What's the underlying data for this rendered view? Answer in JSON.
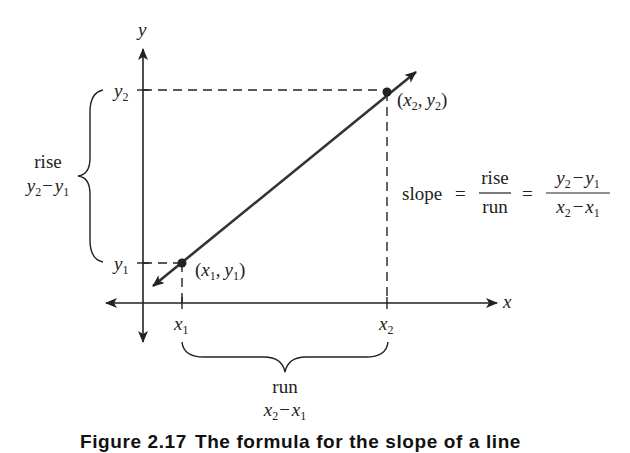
{
  "diagram": {
    "type": "slope-of-line",
    "axes": {
      "x_label": "x",
      "y_label": "y"
    },
    "points": [
      {
        "id": "p1",
        "label": "(x1, y1)",
        "x_name": "x",
        "x_sub": "1",
        "y_name": "y",
        "y_sub": "1"
      },
      {
        "id": "p2",
        "label": "(x2, y2)",
        "x_name": "x",
        "x_sub": "2",
        "y_name": "y",
        "y_sub": "2"
      }
    ],
    "ticks": {
      "x1": {
        "name": "x",
        "sub": "1"
      },
      "x2": {
        "name": "x",
        "sub": "2"
      },
      "y1": {
        "name": "y",
        "sub": "1"
      },
      "y2": {
        "name": "y",
        "sub": "2"
      }
    },
    "rise": {
      "label": "rise",
      "expression": "y2 − y1",
      "a": "y",
      "a_sub": "2",
      "minus": "−",
      "b": "y",
      "b_sub": "1"
    },
    "run": {
      "label": "run",
      "expression": "x2 − x1",
      "a": "x",
      "a_sub": "2",
      "minus": "−",
      "b": "x",
      "b_sub": "1"
    },
    "formula": {
      "lhs": "slope",
      "eq": "=",
      "frac1_num": "rise",
      "frac1_den": "run",
      "frac2_num": "y2 − y1",
      "frac2_den": "x2 − x1"
    },
    "punct": {
      "open": "(",
      "comma": ",",
      "close": ")"
    }
  },
  "caption": {
    "figure_number": "Figure 2.17",
    "text": "The formula for the slope of a line"
  }
}
